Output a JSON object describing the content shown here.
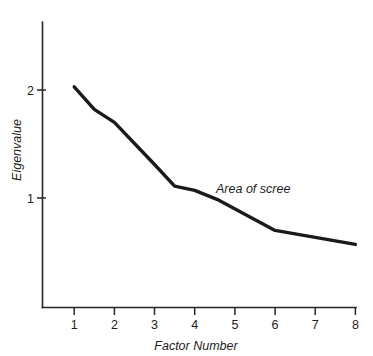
{
  "chart_data": {
    "type": "line",
    "title": "",
    "subtitle": "",
    "xlabel": "Factor Number",
    "ylabel": "Eigenvalue",
    "xlim": [
      0.2,
      8.0
    ],
    "ylim": [
      0.18,
      2.6
    ],
    "grid": false,
    "legend": null,
    "legend_position": "none",
    "x_ticks": [
      1,
      2,
      3,
      4,
      5,
      6,
      7,
      8
    ],
    "x_tick_labels": [
      "1",
      "2",
      "3",
      "4",
      "5",
      "6",
      "7",
      "8"
    ],
    "y_ticks": [
      1,
      2
    ],
    "y_tick_labels": [
      "1",
      "2"
    ],
    "series": [
      {
        "name": "Eigenvalues",
        "color": "#1a1a1a",
        "line_width": 3.4,
        "x": [
          1,
          1.5,
          2,
          3,
          3.5,
          4,
          4.6,
          6,
          8
        ],
        "values": [
          2.03,
          1.82,
          1.7,
          1.31,
          1.11,
          1.07,
          0.98,
          0.7,
          0.57
        ]
      }
    ],
    "annotations": [
      {
        "text": "Area of scree",
        "x": 4.55,
        "y": 1.12,
        "style": "italic"
      }
    ]
  },
  "axis": {
    "x_title": "Factor Number",
    "y_title": "Eigenvalue",
    "x_labels": [
      "1",
      "2",
      "3",
      "4",
      "5",
      "6",
      "7",
      "8"
    ],
    "y_labels": [
      "1",
      "2"
    ]
  },
  "annotation": {
    "scree_label": "Area of scree"
  },
  "colors": {
    "line": "#1a1a1a",
    "axis": "#262626",
    "text": "#1c1c1c",
    "background": "#ffffff"
  }
}
